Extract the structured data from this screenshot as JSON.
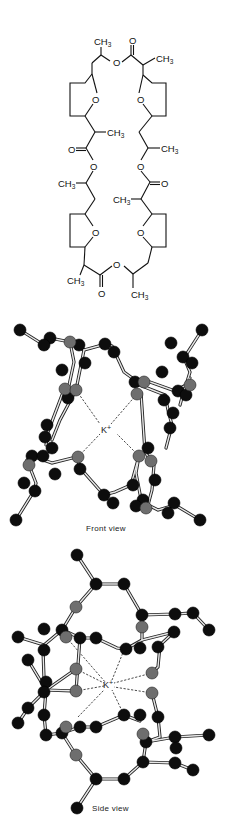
{
  "figure": {
    "structure": {
      "name": "macrotetrolide-structural-formula",
      "labels": {
        "methyl": "CH",
        "methyl_sub": "3",
        "oxygen": "O"
      }
    },
    "front_view": {
      "caption": "Front view",
      "ion_label": "K",
      "ion_charge": "+"
    },
    "side_view": {
      "caption": "Side view",
      "ion_label": "K",
      "ion_charge": "+"
    },
    "legend": {
      "carbon_color": "#0d0d0d",
      "oxygen_color": "#6e6e6e"
    }
  }
}
